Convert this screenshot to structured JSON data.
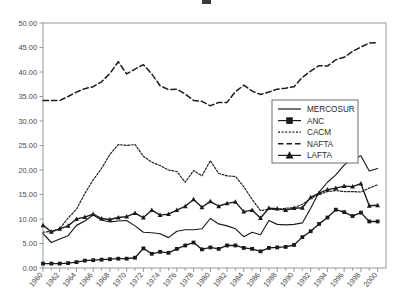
{
  "chart_data": {
    "type": "line",
    "title": "",
    "xlabel": "",
    "ylabel": "",
    "xlim": [
      1960,
      2001
    ],
    "ylim": [
      0,
      50
    ],
    "ytick_step": 5,
    "ytick_labels": [
      "0.00",
      "5.00",
      "10.00",
      "15.00",
      "20.00",
      "25.00",
      "30.00",
      "35.00",
      "40.00",
      "45.00",
      "50.00"
    ],
    "xtick_labels": [
      "1960",
      "1962",
      "1964",
      "1966",
      "1968",
      "1970",
      "1972",
      "1974",
      "1976",
      "1978",
      "1980",
      "1982",
      "1984",
      "1986",
      "1988",
      "1990",
      "1992",
      "1994",
      "1996",
      "1998",
      "2000"
    ],
    "grid": false,
    "legend_position": "center-right",
    "x": [
      1960,
      1961,
      1962,
      1963,
      1964,
      1965,
      1966,
      1967,
      1968,
      1969,
      1970,
      1971,
      1972,
      1973,
      1974,
      1975,
      1976,
      1977,
      1978,
      1979,
      1980,
      1981,
      1982,
      1983,
      1984,
      1985,
      1986,
      1987,
      1988,
      1989,
      1990,
      1991,
      1992,
      1993,
      1994,
      1995,
      1996,
      1997,
      1998,
      1999,
      2000
    ],
    "series": [
      {
        "name": "MERCOSUR",
        "style": "solid",
        "marker": "none",
        "color": "#1a1a1a",
        "values": [
          7.0,
          5.2,
          5.9,
          6.6,
          8.7,
          9.6,
          10.8,
          9.8,
          9.4,
          9.6,
          9.7,
          8.6,
          7.3,
          7.2,
          7.0,
          6.2,
          7.5,
          7.8,
          7.8,
          8.0,
          10.1,
          9.0,
          8.6,
          8.0,
          6.4,
          7.3,
          6.8,
          9.7,
          8.9,
          8.8,
          8.9,
          9.2,
          12.2,
          15.5,
          17.5,
          19.0,
          21.0,
          22.3,
          22.9,
          19.8,
          20.3
        ]
      },
      {
        "name": "ANC",
        "style": "solid",
        "marker": "square",
        "color": "#1a1a1a",
        "values": [
          0.9,
          0.9,
          0.9,
          1.0,
          1.2,
          1.5,
          1.6,
          1.7,
          1.8,
          1.9,
          1.9,
          2.1,
          4.0,
          2.9,
          3.3,
          3.1,
          3.9,
          4.6,
          5.2,
          3.8,
          4.2,
          3.9,
          4.6,
          4.6,
          4.1,
          3.9,
          3.4,
          4.1,
          4.2,
          4.3,
          4.7,
          6.3,
          7.5,
          9.0,
          10.3,
          11.9,
          11.4,
          10.6,
          11.3,
          9.5,
          9.5
        ]
      },
      {
        "name": "CACM",
        "style": "dotted",
        "marker": "none",
        "color": "#1a1a1a",
        "values": [
          7.3,
          7.5,
          8.0,
          10.2,
          12.0,
          15.2,
          18.0,
          20.3,
          23.2,
          25.2,
          25.0,
          25.2,
          22.8,
          21.6,
          20.9,
          20.0,
          19.7,
          17.5,
          19.9,
          18.8,
          21.9,
          19.3,
          18.8,
          18.7,
          16.6,
          14.0,
          11.7,
          12.0,
          11.9,
          12.2,
          12.3,
          13.0,
          14.2,
          15.0,
          15.6,
          15.8,
          15.6,
          15.6,
          15.5,
          16.3,
          17.0
        ]
      },
      {
        "name": "NAFTA",
        "style": "dashed",
        "marker": "none",
        "color": "#1a1a1a",
        "values": [
          34.2,
          34.2,
          34.2,
          35.0,
          35.9,
          36.6,
          37.0,
          38.0,
          39.7,
          42.1,
          39.6,
          40.6,
          41.5,
          39.6,
          37.2,
          36.4,
          36.5,
          35.5,
          34.2,
          34.0,
          33.1,
          33.8,
          33.8,
          36.0,
          37.3,
          36.1,
          35.4,
          35.9,
          36.5,
          36.7,
          37.0,
          38.9,
          40.2,
          41.3,
          41.2,
          42.5,
          43.0,
          44.2,
          45.1,
          45.9,
          46.0
        ]
      },
      {
        "name": "LAFTA",
        "style": "solid",
        "marker": "triangle",
        "color": "#1a1a1a",
        "values": [
          8.7,
          7.4,
          8.0,
          8.6,
          10.0,
          10.4,
          11.0,
          10.1,
          9.9,
          10.3,
          10.5,
          11.2,
          10.3,
          11.8,
          10.8,
          11.0,
          11.8,
          12.6,
          14.0,
          12.4,
          13.6,
          12.6,
          13.2,
          13.5,
          11.5,
          11.8,
          10.2,
          12.2,
          12.1,
          11.8,
          12.2,
          12.3,
          14.4,
          15.3,
          16.0,
          16.3,
          16.7,
          16.6,
          17.2,
          12.7,
          12.8
        ]
      }
    ]
  },
  "legend": {
    "entries": [
      {
        "label": "MERCOSUR",
        "style": "solid",
        "marker": "none"
      },
      {
        "label": "ANC",
        "style": "solid",
        "marker": "square"
      },
      {
        "label": "CACM",
        "style": "dotted",
        "marker": "none"
      },
      {
        "label": "NAFTA",
        "style": "dashed",
        "marker": "none"
      },
      {
        "label": "LAFTA",
        "style": "solid",
        "marker": "triangle"
      }
    ]
  }
}
